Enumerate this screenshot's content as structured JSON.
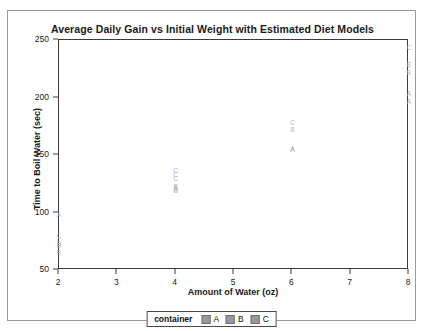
{
  "chart_data": {
    "type": "scatter",
    "title": "Average Daily Gain vs Initial Weight with Estimated Diet Models",
    "xlabel": "Amount of Water (oz)",
    "ylabel": "Time to Boil Water (sec)",
    "xlim": [
      2,
      8
    ],
    "ylim": [
      50,
      250
    ],
    "xticks": [
      2,
      3,
      4,
      5,
      6,
      7,
      8
    ],
    "yticks": [
      50,
      100,
      150,
      200,
      250
    ],
    "grid": false,
    "marker_style": "letter-labels",
    "legend": {
      "position": "bottom-outside",
      "title": "container",
      "entries": [
        {
          "label": "A",
          "color": "#9a9a9a"
        },
        {
          "label": "B",
          "color": "#9a9a9a"
        },
        {
          "label": "C",
          "color": "#9a9a9a"
        }
      ]
    },
    "series": [
      {
        "name": "A",
        "points": [
          {
            "x": 2,
            "y": 98
          },
          {
            "x": 4,
            "y": 121
          },
          {
            "x": 4,
            "y": 120
          },
          {
            "x": 6,
            "y": 155
          },
          {
            "x": 6,
            "y": 154
          },
          {
            "x": 8,
            "y": 203
          },
          {
            "x": 8,
            "y": 196
          }
        ]
      },
      {
        "name": "B",
        "points": [
          {
            "x": 2,
            "y": 73
          },
          {
            "x": 2,
            "y": 71
          },
          {
            "x": 2,
            "y": 65
          },
          {
            "x": 4,
            "y": 122
          },
          {
            "x": 4,
            "y": 119
          },
          {
            "x": 6,
            "y": 172
          },
          {
            "x": 8,
            "y": 228
          },
          {
            "x": 8,
            "y": 221
          }
        ]
      },
      {
        "name": "C",
        "points": [
          {
            "x": 2,
            "y": 80
          },
          {
            "x": 4,
            "y": 136
          },
          {
            "x": 4,
            "y": 133
          },
          {
            "x": 4,
            "y": 129
          },
          {
            "x": 6,
            "y": 178
          },
          {
            "x": 8,
            "y": 243
          }
        ]
      }
    ],
    "markers": [
      {
        "label": "A",
        "x": 2,
        "y": 98
      },
      {
        "label": "C",
        "x": 2,
        "y": 80
      },
      {
        "label": "B",
        "x": 2,
        "y": 73
      },
      {
        "label": "B",
        "x": 2,
        "y": 71
      },
      {
        "label": "B",
        "x": 2,
        "y": 65
      },
      {
        "label": "C",
        "x": 4,
        "y": 136
      },
      {
        "label": "C",
        "x": 4,
        "y": 133
      },
      {
        "label": "C",
        "x": 4,
        "y": 129
      },
      {
        "label": "B",
        "x": 4,
        "y": 122
      },
      {
        "label": "A",
        "x": 4,
        "y": 121
      },
      {
        "label": "A",
        "x": 4,
        "y": 120
      },
      {
        "label": "B",
        "x": 4,
        "y": 119
      },
      {
        "label": "C",
        "x": 6,
        "y": 178
      },
      {
        "label": "B",
        "x": 6,
        "y": 172
      },
      {
        "label": "A",
        "x": 6,
        "y": 155
      },
      {
        "label": "A",
        "x": 6,
        "y": 154
      },
      {
        "label": "C",
        "x": 8,
        "y": 243
      },
      {
        "label": "B",
        "x": 8,
        "y": 228
      },
      {
        "label": "B",
        "x": 8,
        "y": 221
      },
      {
        "label": "A",
        "x": 8,
        "y": 203
      },
      {
        "label": "A",
        "x": 8,
        "y": 196
      }
    ]
  }
}
